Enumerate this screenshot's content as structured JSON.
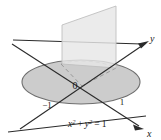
{
  "figure": {
    "kind": "3d-math-diagram",
    "background_color": "#ffffff",
    "axes": {
      "x_label": "x",
      "y_label": "y",
      "axis_color": "#2b2b2b"
    },
    "origin_label": "0",
    "ticks": [
      {
        "name": "tick-negative-one",
        "label": "−1"
      },
      {
        "name": "tick-positive-one",
        "label": "1"
      }
    ],
    "equation": {
      "x_var": "x",
      "x_exp": "2",
      "plus": "+",
      "y_var": "y",
      "y_exp": "2",
      "equals": "=",
      "rhs": "1",
      "full_text": "x² + y² = 1"
    },
    "shapes": {
      "disk": {
        "name": "unit-disk",
        "fill": "#c9c9c9",
        "stroke": "#6e6e6e",
        "cx": 81,
        "cy": 82,
        "rx": 59,
        "ry": 22
      },
      "plane": {
        "name": "vertical-plane",
        "fill": "#e3e3e3",
        "stroke": "#b4b4b4"
      },
      "dashed_color": "#9a9a9a"
    }
  }
}
